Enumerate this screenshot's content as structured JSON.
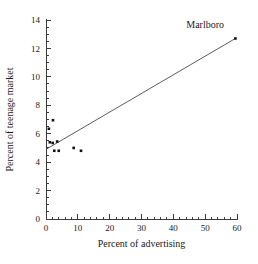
{
  "chart_data": {
    "type": "scatter",
    "title": "",
    "xlabel": "Percent of advertising",
    "ylabel": "Percent of teenage market",
    "xlim": [
      0,
      60
    ],
    "ylim": [
      0,
      14
    ],
    "x_ticks": [
      0,
      10,
      20,
      30,
      40,
      50,
      60
    ],
    "y_ticks": [
      0,
      2,
      4,
      6,
      8,
      10,
      12,
      14
    ],
    "x_tick_labels": [
      "0",
      "10",
      "20",
      "30",
      "40",
      "50",
      "60"
    ],
    "y_tick_labels": [
      "0",
      "2",
      "4",
      "6",
      "8",
      "10",
      "12",
      "14"
    ],
    "x_minor_step": 2,
    "y_minor_step": 0.5,
    "grid": false,
    "legend": false,
    "points": [
      {
        "x": 0.9,
        "y": 6.35
      },
      {
        "x": 2.2,
        "y": 6.95
      },
      {
        "x": 1.2,
        "y": 5.4
      },
      {
        "x": 2.1,
        "y": 5.35
      },
      {
        "x": 2.6,
        "y": 4.8
      },
      {
        "x": 3.5,
        "y": 5.45
      },
      {
        "x": 4.0,
        "y": 4.8
      },
      {
        "x": 8.7,
        "y": 5.0
      },
      {
        "x": 11.0,
        "y": 4.8
      },
      {
        "x": 59.5,
        "y": 12.7
      }
    ],
    "fit_line": {
      "x0": 0,
      "y0": 4.9,
      "x1": 59.5,
      "y1": 12.7
    },
    "annotations": [
      {
        "text": "Marlboro",
        "x": 50.0,
        "y": 13.45
      }
    ],
    "marker_color": "#111111",
    "line_color": "#4a4a4a",
    "axis_color": "#3a3a3a",
    "background": "#ffffff"
  }
}
